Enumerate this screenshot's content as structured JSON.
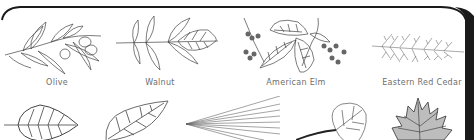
{
  "card": {
    "border_color": "#1a1a1a",
    "background": "#ffffff"
  },
  "leaves_row1": [
    {
      "name": "Olive",
      "icon": "olive-branch-icon",
      "label_x": 57
    },
    {
      "name": "Walnut",
      "icon": "walnut-leaf-icon",
      "label_x": 160
    },
    {
      "name": "American Elm",
      "icon": "american-elm-branch-icon",
      "label_x": 296
    },
    {
      "name": "Eastern Red Cedar",
      "icon": "eastern-red-cedar-sprig-icon",
      "label_x": 422
    }
  ],
  "leaves_row2": [
    {
      "icon": "birch-leaf-icon"
    },
    {
      "icon": "willow-oak-leaf-icon"
    },
    {
      "icon": "pine-needles-icon"
    },
    {
      "icon": "aspen-leaf-icon"
    },
    {
      "icon": "maple-leaf-icon"
    }
  ],
  "colors": {
    "label_text": "#6e6e6e",
    "line_art": "#444444"
  }
}
